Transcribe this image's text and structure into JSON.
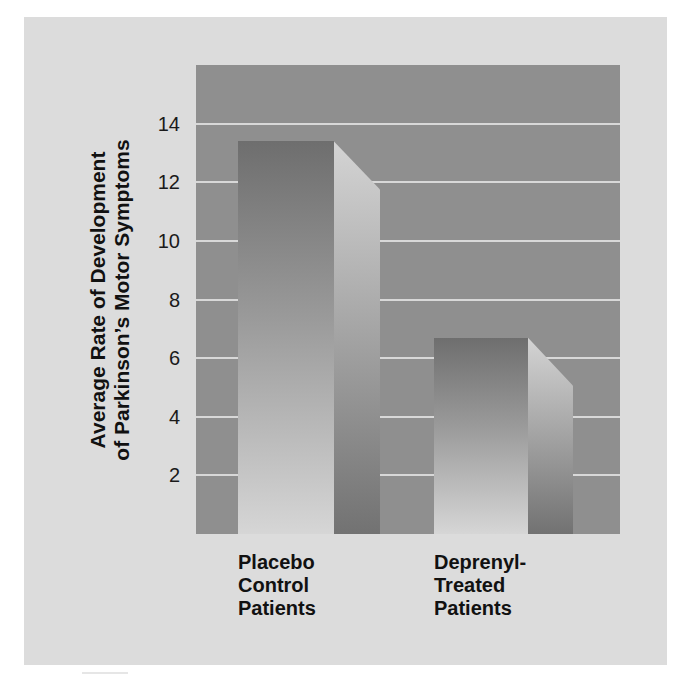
{
  "chart_data": {
    "type": "bar",
    "title": "",
    "xlabel": "",
    "ylabel": "Average Rate of Development of Parkinson's Motor Symptoms",
    "ylabel_lines": [
      "Average Rate of Development",
      "of Parkinson’s Motor Symptoms"
    ],
    "categories": [
      "Placebo Control Patients",
      "Deprenyl-Treated Patients"
    ],
    "category_lines": [
      [
        "Placebo",
        "Control",
        "Patients"
      ],
      [
        "Deprenyl-",
        "Treated",
        "Patients"
      ]
    ],
    "values": [
      13.4,
      6.7
    ],
    "yticks": [
      2,
      4,
      6,
      8,
      10,
      12,
      14
    ],
    "ylim": [
      0,
      16
    ],
    "grid": true,
    "legend": null,
    "style": "3d-shaded-bars"
  },
  "colors": {
    "panel_bg": "#dcdcdc",
    "plot_bg": "#8f8f8f",
    "gridline": "#d8d8d8",
    "bar_front_top": "#6e6e6e",
    "bar_front_bottom": "#d6d6d6",
    "bar_side_top": "#d4d4d4",
    "bar_side_bottom": "#727272"
  }
}
